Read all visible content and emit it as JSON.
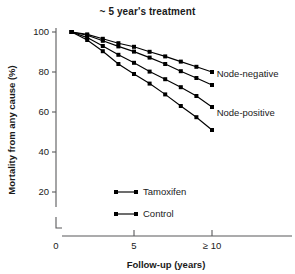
{
  "chart_data": {
    "type": "line",
    "title": "~ 5 year's treatment",
    "xlabel": "Follow-up (years)",
    "ylabel": "Mortality from any cause (%)",
    "xlim": [
      0,
      10
    ],
    "ylim": [
      0,
      100
    ],
    "xticks": [
      0,
      5,
      10
    ],
    "xticklabels": [
      "0",
      "5",
      "≥ 10"
    ],
    "yticks": [
      20,
      40,
      60,
      80,
      100
    ],
    "yticklabels": [
      "20",
      "40",
      "60",
      "80",
      "100"
    ],
    "grid": false,
    "legend_position": "lower-center-inside",
    "axis_break_y": true,
    "x": [
      1,
      2,
      3,
      4,
      5,
      6,
      7,
      8,
      9,
      10
    ],
    "series": [
      {
        "name": "Node-negative Tamoxifen",
        "group": "Node-negative",
        "arm": "Tamoxifen",
        "values": [
          100,
          98.8,
          96.6,
          94.4,
          92.6,
          90.1,
          87.8,
          85.2,
          82.6,
          80.0
        ]
      },
      {
        "name": "Node-negative Control",
        "group": "Node-negative",
        "arm": "Control",
        "values": [
          100,
          98.4,
          95.6,
          92.8,
          90.2,
          87.2,
          84.0,
          80.4,
          77.0,
          73.5
        ]
      },
      {
        "name": "Node-positive Tamoxifen",
        "group": "Node-positive",
        "arm": "Tamoxifen",
        "values": [
          100,
          97.2,
          93.0,
          88.6,
          84.6,
          80.2,
          76.4,
          72.4,
          68.0,
          62.5
        ]
      },
      {
        "name": "Node-positive Control",
        "group": "Node-positive",
        "arm": "Control",
        "values": [
          100,
          96.0,
          90.4,
          84.0,
          79.0,
          74.2,
          68.8,
          63.0,
          57.4,
          51.0
        ]
      }
    ],
    "annotations": [
      {
        "text": "Node-negative",
        "x": 10.3,
        "y": 79.0
      },
      {
        "text": "Node-positive",
        "x": 10.3,
        "y": 59.5
      }
    ],
    "legend": [
      {
        "label": "Tamoxifen",
        "marker": "square",
        "color": "#000000"
      },
      {
        "label": "Control",
        "marker": "square",
        "color": "#000000"
      }
    ]
  }
}
